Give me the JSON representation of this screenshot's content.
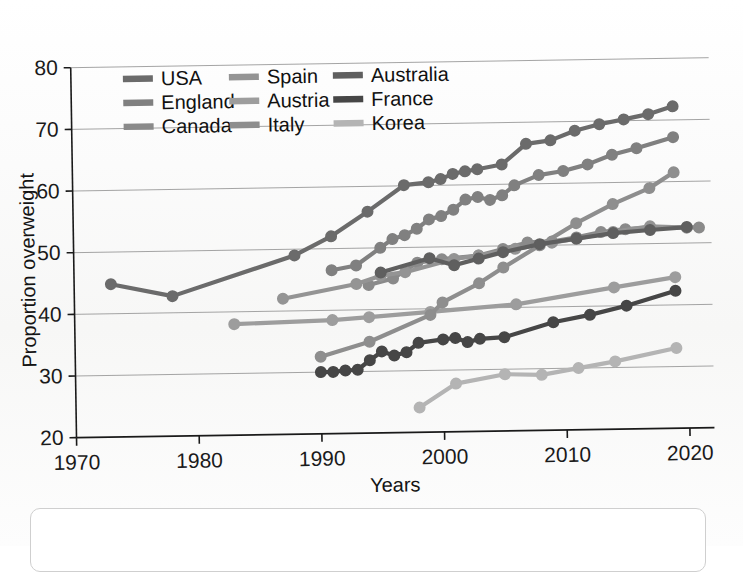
{
  "figure": {
    "type": "line-chart",
    "background_color": "#fbfbfb",
    "ink_color": "#1a1a1a"
  },
  "axes": {
    "x_title": "Years",
    "y_title": "Proportion overweight",
    "x_ticks": [
      "1970",
      "1980",
      "1990",
      "2000",
      "2010",
      "2020"
    ],
    "y_ticks": [
      "20",
      "30",
      "40",
      "50",
      "60",
      "70",
      "80"
    ]
  },
  "legend": {
    "columns": 3,
    "rows": 3,
    "entries": [
      {
        "label": "USA",
        "color": "#6b6b6b"
      },
      {
        "label": "Spain",
        "color": "#949494"
      },
      {
        "label": "Australia",
        "color": "#5f5f5f"
      },
      {
        "label": "England",
        "color": "#808080"
      },
      {
        "label": "Austria",
        "color": "#9d9d9d"
      },
      {
        "label": "France",
        "color": "#464646"
      },
      {
        "label": "Canada",
        "color": "#8a8a8a"
      },
      {
        "label": "Italy",
        "color": "#8e8e8e"
      },
      {
        "label": "Korea",
        "color": "#b4b4b4"
      }
    ]
  },
  "chart_data": {
    "type": "line",
    "title": "",
    "subtitle": "",
    "xlabel": "Years",
    "ylabel": "Proportion overweight",
    "xlim": [
      1970,
      2022
    ],
    "ylim": [
      20,
      80
    ],
    "x_ticks": [
      1970,
      1980,
      1990,
      2000,
      2010,
      2020
    ],
    "y_ticks": [
      20,
      30,
      40,
      50,
      60,
      70,
      80
    ],
    "grid": "horizontal",
    "legend_position": "top-left-inside",
    "markers": "filled-circles",
    "series": [
      {
        "name": "USA",
        "color": "#6b6b6b",
        "points": [
          [
            1973,
            44.8
          ],
          [
            1978,
            42.7
          ],
          [
            1988,
            49.0
          ],
          [
            1991,
            52.0
          ],
          [
            1994,
            55.9
          ],
          [
            1997,
            60.1
          ],
          [
            1999,
            60.5
          ],
          [
            2000,
            61.0
          ],
          [
            2001,
            61.8
          ],
          [
            2002,
            62.2
          ],
          [
            2003,
            62.5
          ],
          [
            2005,
            63.2
          ],
          [
            2007,
            66.5
          ],
          [
            2009,
            67.0
          ],
          [
            2011,
            68.5
          ],
          [
            2013,
            69.5
          ],
          [
            2015,
            70.2
          ],
          [
            2017,
            71.0
          ],
          [
            2019,
            72.2
          ]
        ]
      },
      {
        "name": "England",
        "color": "#808080",
        "points": [
          [
            1991,
            46.5
          ],
          [
            1993,
            47.2
          ],
          [
            1995,
            50.0
          ],
          [
            1996,
            51.4
          ],
          [
            1997,
            52.0
          ],
          [
            1998,
            53.0
          ],
          [
            1999,
            54.5
          ],
          [
            2000,
            55.0
          ],
          [
            2001,
            56.0
          ],
          [
            2002,
            57.6
          ],
          [
            2003,
            58.0
          ],
          [
            2004,
            57.5
          ],
          [
            2005,
            58.2
          ],
          [
            2006,
            59.8
          ],
          [
            2008,
            61.4
          ],
          [
            2010,
            62.0
          ],
          [
            2012,
            63.0
          ],
          [
            2014,
            64.5
          ],
          [
            2016,
            65.5
          ],
          [
            2019,
            67.2
          ]
        ]
      },
      {
        "name": "Canada",
        "color": "#8a8a8a",
        "points": [
          [
            1994,
            44.0
          ],
          [
            1996,
            45.0
          ],
          [
            1998,
            47.5
          ],
          [
            2000,
            48.0
          ],
          [
            2003,
            48.5
          ],
          [
            2005,
            49.5
          ],
          [
            2007,
            50.5
          ],
          [
            2009,
            50.6
          ],
          [
            2011,
            51.2
          ],
          [
            2013,
            52.0
          ],
          [
            2015,
            52.4
          ],
          [
            2017,
            52.6
          ],
          [
            2021,
            52.5
          ]
        ]
      },
      {
        "name": "Spain",
        "color": "#949494",
        "points": [
          [
            1987,
            42.0
          ],
          [
            1993,
            44.2
          ],
          [
            1995,
            45.5
          ],
          [
            1997,
            46.0
          ],
          [
            2001,
            48.0
          ],
          [
            2003,
            48.5
          ],
          [
            2006,
            49.5
          ],
          [
            2009,
            50.4
          ],
          [
            2011,
            51.0
          ],
          [
            2014,
            52.0
          ],
          [
            2017,
            52.8
          ],
          [
            2020,
            52.5
          ]
        ]
      },
      {
        "name": "Austria",
        "color": "#9d9d9d",
        "points": [
          [
            1983,
            38.0
          ],
          [
            1991,
            38.4
          ],
          [
            1994,
            38.8
          ],
          [
            1999,
            39.5
          ],
          [
            2006,
            40.5
          ],
          [
            2014,
            43.0
          ],
          [
            2019,
            44.5
          ]
        ]
      },
      {
        "name": "Italy",
        "color": "#8e8e8e",
        "points": [
          [
            1990,
            32.5
          ],
          [
            1994,
            34.8
          ],
          [
            1999,
            39.0
          ],
          [
            2000,
            41.0
          ],
          [
            2003,
            44.0
          ],
          [
            2005,
            46.5
          ],
          [
            2008,
            50.0
          ],
          [
            2011,
            53.5
          ],
          [
            2014,
            56.5
          ],
          [
            2017,
            59.0
          ],
          [
            2019,
            61.5
          ]
        ]
      },
      {
        "name": "Australia",
        "color": "#5f5f5f",
        "points": [
          [
            1995,
            46.0
          ],
          [
            1999,
            48.2
          ],
          [
            2001,
            47.0
          ],
          [
            2003,
            48.0
          ],
          [
            2005,
            49.0
          ],
          [
            2008,
            50.2
          ],
          [
            2011,
            51.0
          ],
          [
            2014,
            51.8
          ],
          [
            2017,
            52.2
          ],
          [
            2020,
            52.6
          ]
        ]
      },
      {
        "name": "France",
        "color": "#464646",
        "points": [
          [
            1990,
            30.0
          ],
          [
            1991,
            30.0
          ],
          [
            1992,
            30.2
          ],
          [
            1993,
            30.3
          ],
          [
            1994,
            31.8
          ],
          [
            1995,
            33.2
          ],
          [
            1996,
            32.5
          ],
          [
            1997,
            33.0
          ],
          [
            1998,
            34.5
          ],
          [
            2000,
            35.0
          ],
          [
            2001,
            35.2
          ],
          [
            2002,
            34.5
          ],
          [
            2003,
            35.0
          ],
          [
            2005,
            35.2
          ],
          [
            2009,
            37.5
          ],
          [
            2012,
            38.6
          ],
          [
            2015,
            40.0
          ],
          [
            2019,
            42.3
          ]
        ]
      },
      {
        "name": "Korea",
        "color": "#b4b4b4",
        "points": [
          [
            1998,
            24.0
          ],
          [
            2001,
            27.8
          ],
          [
            2005,
            29.2
          ],
          [
            2008,
            29.0
          ],
          [
            2011,
            30.0
          ],
          [
            2014,
            31.0
          ],
          [
            2019,
            33.0
          ]
        ]
      }
    ]
  }
}
